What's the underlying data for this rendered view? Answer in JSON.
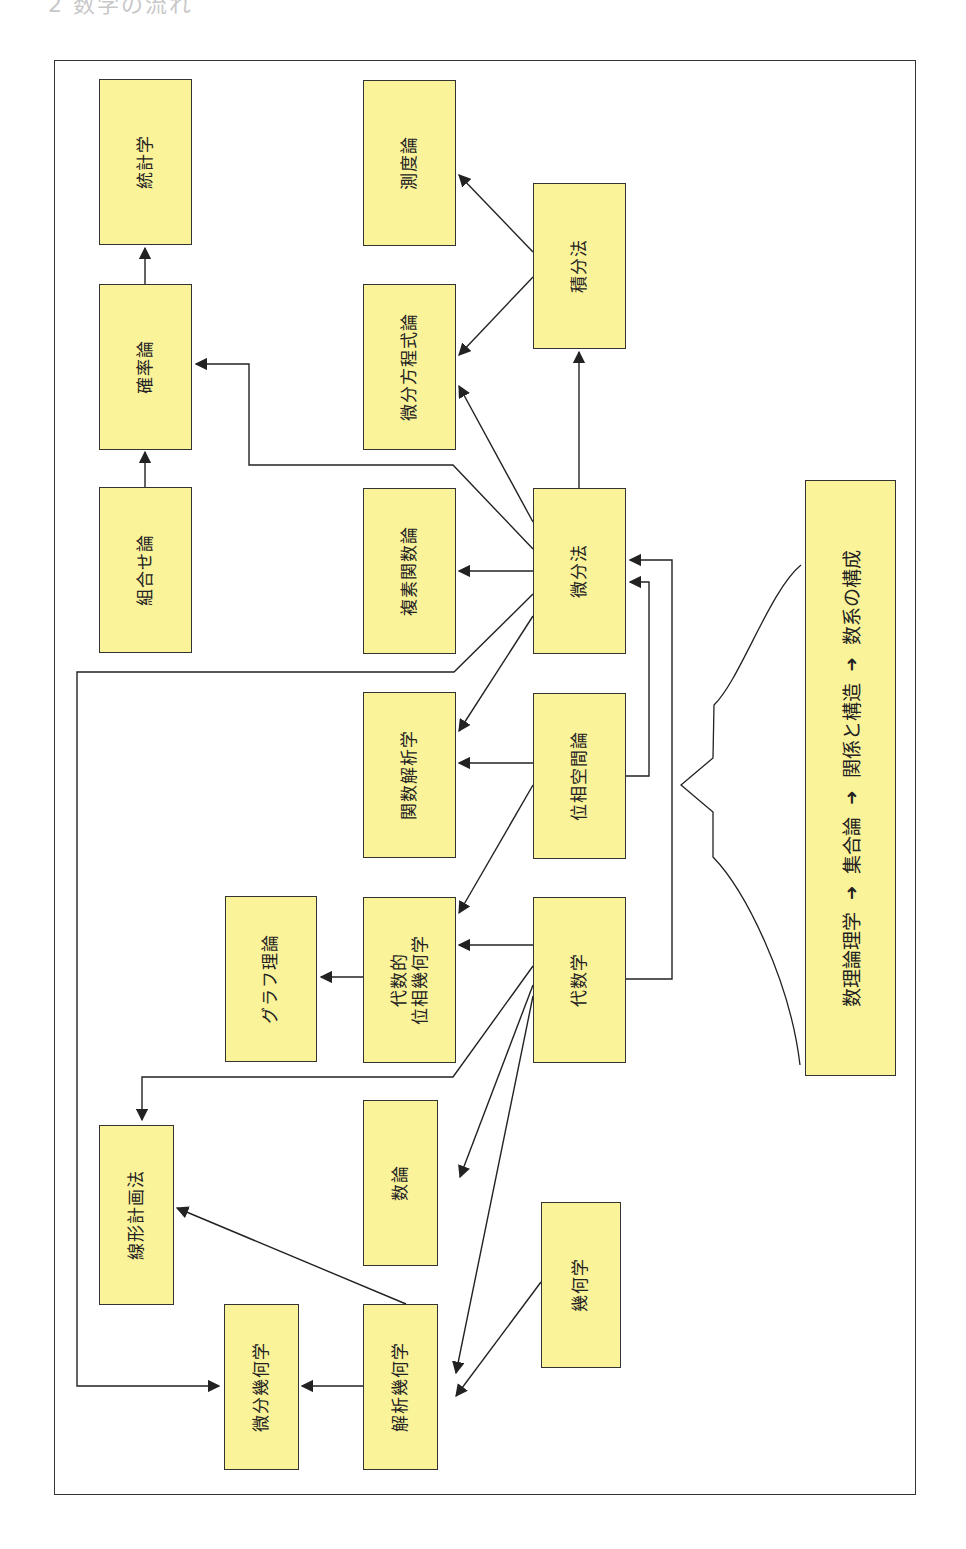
{
  "heading": "2 数学の流れ",
  "colors": {
    "node_fill": "#fbf39a",
    "border": "#333333",
    "line": "#222222"
  },
  "nodes": {
    "toukeigaku": "統計学",
    "kakuritsuron": "確率論",
    "kumiawaseron": "組合せ論",
    "sokudoron": "測度論",
    "bibunhouteishikiron": "微分方程式論",
    "fukusokansuuron": "複素関数論",
    "kansuukaisekigaku": "関数解析学",
    "daisuuteki_line1": "代数的",
    "daisuuteki_line2": "位相幾何学",
    "suuron": "数論",
    "kaisekikikagaku": "解析幾何学",
    "bibunkikagaku": "微分幾何学",
    "senkeikeikakuhou": "線形計画法",
    "graphriron": "グラフ理論",
    "sekibunhou": "積分法",
    "bibunhou": "微分法",
    "isoukuukanron": "位相空間論",
    "daisuugaku": "代数学",
    "kikagaku": "幾何学"
  },
  "foundation_bar": {
    "steps": [
      "数理論理学",
      "集合論",
      "関係と構造",
      "数系の構成"
    ],
    "arrow": "➜"
  },
  "edges": [
    [
      "組合せ論",
      "確率論"
    ],
    [
      "確率論",
      "統計学"
    ],
    [
      "積分法",
      "測度論"
    ],
    [
      "積分法",
      "微分方程式論"
    ],
    [
      "微分法",
      "積分法"
    ],
    [
      "微分法",
      "微分方程式論"
    ],
    [
      "微分法",
      "確率論"
    ],
    [
      "微分法",
      "複素関数論"
    ],
    [
      "微分法",
      "関数解析学"
    ],
    [
      "微分法",
      "微分幾何学"
    ],
    [
      "位相空間論",
      "関数解析学"
    ],
    [
      "位相空間論",
      "代数的位相幾何学"
    ],
    [
      "位相空間論",
      "微分法"
    ],
    [
      "代数学",
      "微分法"
    ],
    [
      "代数学",
      "代数的位相幾何学"
    ],
    [
      "代数学",
      "線形計画法"
    ],
    [
      "代数学",
      "数論"
    ],
    [
      "代数学",
      "解析幾何学"
    ],
    [
      "代数的位相幾何学",
      "グラフ理論"
    ],
    [
      "解析幾何学",
      "線形計画法"
    ],
    [
      "解析幾何学",
      "微分幾何学"
    ],
    [
      "幾何学",
      "解析幾何学"
    ]
  ]
}
